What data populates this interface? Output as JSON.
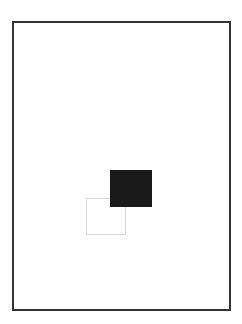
{
  "figure": {
    "title": "",
    "caption": "",
    "background_color": "#ffffff",
    "frame": {
      "name": "figure-frame",
      "border_color": "#333333",
      "border_width_px": 2,
      "x": 12,
      "y": 21,
      "width": 219,
      "height": 290
    },
    "shapes": [
      {
        "id": "square-outline",
        "label": "",
        "kind": "square",
        "style": "outlined",
        "fill_color": "none",
        "stroke_color": "#d8d8d8",
        "stroke_width_px": 1,
        "x": 86,
        "y": 198,
        "width": 40,
        "height": 37,
        "z_order": 1
      },
      {
        "id": "square-filled",
        "label": "",
        "kind": "square",
        "style": "filled",
        "fill_color": "#1a1a1a",
        "stroke_color": "none",
        "stroke_width_px": 0,
        "x": 110,
        "y": 170,
        "width": 42,
        "height": 37,
        "z_order": 2
      }
    ]
  }
}
